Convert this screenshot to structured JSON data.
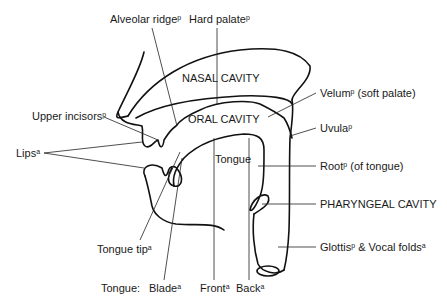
{
  "diagram": {
    "regions": {
      "nasal_cavity": "NASAL CAVITY",
      "oral_cavity": "ORAL CAVITY",
      "tongue": "Tongue",
      "pharyngeal_cavity": "PHARYNGEAL CAVITY"
    },
    "labels": {
      "alveolar_ridge": {
        "text": "Alveolar ridge",
        "sup": "p"
      },
      "hard_palate": {
        "text": "Hard palate",
        "sup": "p"
      },
      "velum": {
        "text": "Velum",
        "sup": "p",
        "suffix": " (soft palate)"
      },
      "uvula": {
        "text": "Uvula",
        "sup": "p"
      },
      "upper_incisors": {
        "text": "Upper incisors",
        "sup": "p"
      },
      "lips": {
        "text": "Lips",
        "sup": "a"
      },
      "root": {
        "text": "Root",
        "sup": "p",
        "suffix": " (of tongue)"
      },
      "glottis": {
        "text": "Glottis",
        "sup": "p",
        "mid": " & Vocal folds",
        "sup2": "a"
      },
      "tongue_tip": {
        "text": "Tongue tip",
        "sup": "a"
      },
      "tongue_prefix": "Tongue:",
      "blade": {
        "text": "Blade",
        "sup": "a"
      },
      "front": {
        "text": "Front",
        "sup": "a"
      },
      "back": {
        "text": "Back",
        "sup": "a"
      }
    },
    "legend_note": {
      "p": "passive articulator",
      "a": "active articulator"
    }
  }
}
